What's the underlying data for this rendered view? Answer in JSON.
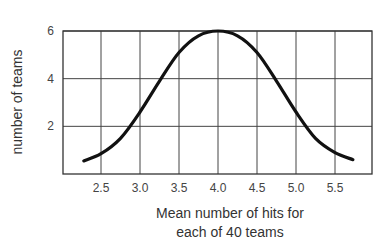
{
  "chart_data": {
    "type": "line",
    "title": "",
    "xlabel": "Mean number of hits for each of 40 teams",
    "xlabel_lines": [
      "Mean number of hits for",
      "each of 40 teams"
    ],
    "ylabel": "number of teams",
    "xlim": [
      2.0,
      6.0
    ],
    "ylim": [
      0,
      6
    ],
    "x_ticks": [
      2.5,
      3.0,
      3.5,
      4.0,
      4.5,
      5.0,
      5.5
    ],
    "x_tick_labels": [
      "2.5",
      "3.0",
      "3.5",
      "4.0",
      "4.5",
      "5.0",
      "5.5"
    ],
    "y_ticks": [
      2,
      4,
      6
    ],
    "y_tick_labels": [
      "2",
      "4",
      "6"
    ],
    "grid": true,
    "legend": null,
    "series": [
      {
        "name": "distribution of team means",
        "x": [
          2.28,
          2.5,
          2.75,
          3.0,
          3.25,
          3.5,
          3.75,
          4.0,
          4.25,
          4.5,
          4.75,
          5.0,
          5.25,
          5.5,
          5.73
        ],
        "y": [
          0.55,
          0.85,
          1.5,
          2.6,
          3.9,
          5.1,
          5.8,
          6.0,
          5.8,
          5.1,
          3.9,
          2.6,
          1.5,
          0.9,
          0.6
        ]
      }
    ],
    "color": "#111111",
    "grid_color": "#333333"
  }
}
